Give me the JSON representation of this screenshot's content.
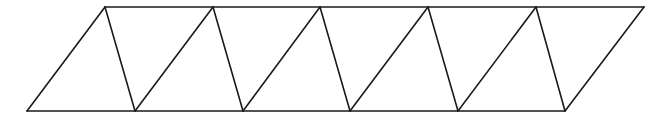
{
  "diagram": {
    "type": "triangle-strip-parallelogram",
    "stroke_color": "#1a1a1a",
    "background_color": "#ffffff",
    "top_vertices": [
      [
        105,
        7
      ],
      [
        213,
        7
      ],
      [
        320,
        7
      ],
      [
        428,
        7
      ],
      [
        536,
        7
      ],
      [
        644,
        7
      ]
    ],
    "bottom_vertices": [
      [
        27,
        111
      ],
      [
        135,
        111
      ],
      [
        243,
        111
      ],
      [
        350,
        111
      ],
      [
        458,
        111
      ],
      [
        565,
        111
      ]
    ],
    "triangle_count": 10
  }
}
